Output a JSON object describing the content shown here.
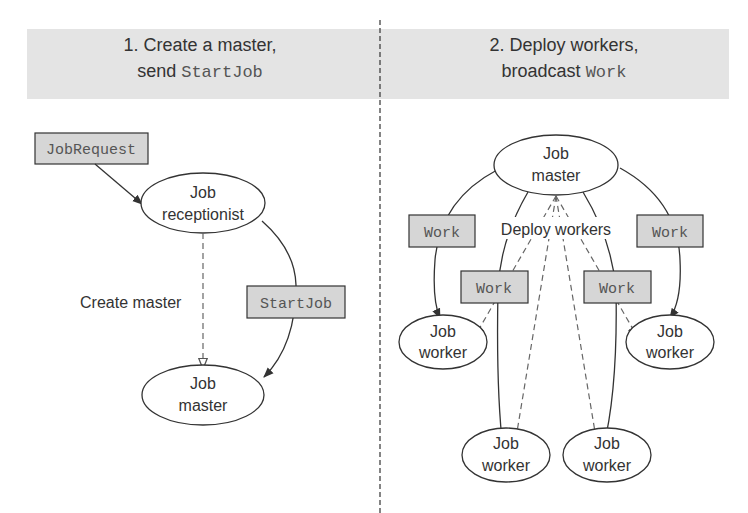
{
  "panels": [
    {
      "title_line1": "1. Create a master,",
      "title_line2_prefix": "send ",
      "title_line2_code": "StartJob"
    },
    {
      "title_line1": "2. Deploy workers,",
      "title_line2_prefix": "broadcast ",
      "title_line2_code": "Work"
    }
  ],
  "left": {
    "job_request": "JobRequest",
    "receptionist": {
      "line1": "Job",
      "line2": "receptionist"
    },
    "create_master_label": "Create master",
    "start_job": "StartJob",
    "master": {
      "line1": "Job",
      "line2": "master"
    }
  },
  "right": {
    "master": {
      "line1": "Job",
      "line2": "master"
    },
    "deploy_label": "Deploy workers",
    "work_messages": [
      "Work",
      "Work",
      "Work",
      "Work"
    ],
    "workers": [
      {
        "line1": "Job",
        "line2": "worker"
      },
      {
        "line1": "Job",
        "line2": "worker"
      },
      {
        "line1": "Job",
        "line2": "worker"
      },
      {
        "line1": "Job",
        "line2": "worker"
      }
    ]
  },
  "colors": {
    "band": "#e4e4e4",
    "message_box": "#d6d6d6",
    "stroke": "#333333"
  }
}
